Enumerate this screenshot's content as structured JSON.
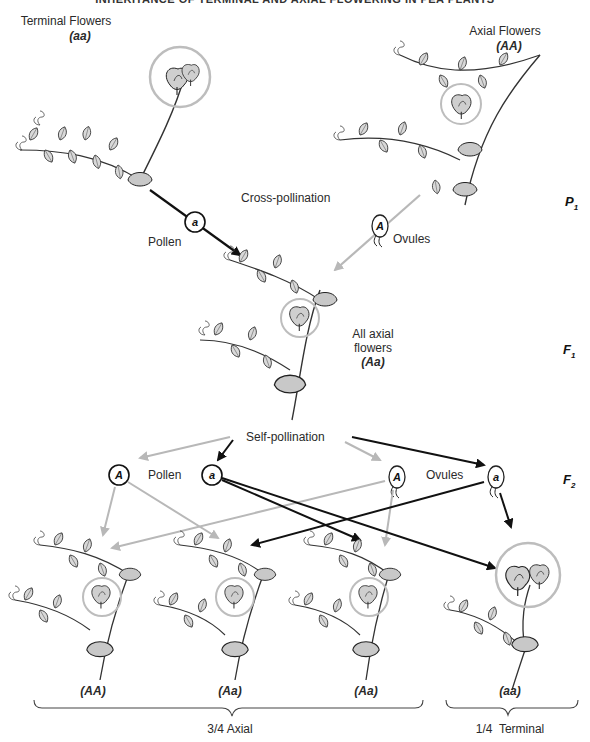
{
  "title": "INHERITANCE OF TERMINAL AND AXIAL FLOWERING IN PEA PLANTS",
  "colors": {
    "dominant_arrow": "#b8b8b8",
    "recessive_arrow": "#111111",
    "circle_highlight": "#bdbdbd",
    "ink": "#2a2a2a"
  },
  "parents": {
    "left": {
      "label": "Terminal Flowers",
      "genotype": "aa"
    },
    "right": {
      "label": "Axial Flowers",
      "genotype": "AA"
    },
    "cross_label": "Cross-pollination",
    "pollen_label": "Pollen",
    "pollen_allele": "a",
    "ovules_label": "Ovules",
    "ovule_allele": "A",
    "generation": "P",
    "generation_sub": "1"
  },
  "f1": {
    "label_line1": "All axial",
    "label_line2": "flowers",
    "genotype": "Aa",
    "generation": "F",
    "generation_sub": "1"
  },
  "f2_gametes": {
    "self_label": "Self-pollination",
    "pollen_label": "Pollen",
    "ovules_label": "Ovules",
    "pollen": [
      "A",
      "a"
    ],
    "ovules": [
      "A",
      "a"
    ],
    "generation": "F",
    "generation_sub": "2"
  },
  "offspring": [
    {
      "genotype": "AA",
      "phenotype": "axial"
    },
    {
      "genotype": "Aa",
      "phenotype": "axial"
    },
    {
      "genotype": "Aa",
      "phenotype": "axial"
    },
    {
      "genotype": "aa",
      "phenotype": "terminal"
    }
  ],
  "ratios": {
    "axial": "3/4 Axial",
    "terminal": "1/4  Terminal"
  }
}
